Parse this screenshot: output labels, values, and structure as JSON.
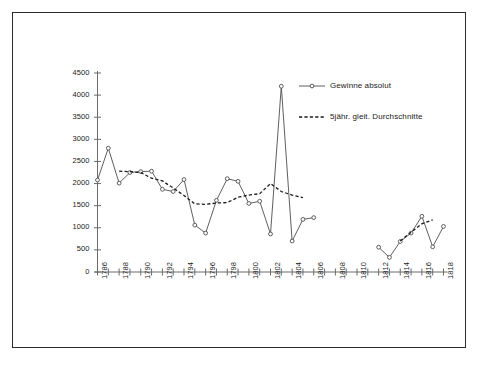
{
  "chart_data": {
    "type": "line",
    "title": "",
    "subtitle": "",
    "xlabel": "",
    "ylabel": "",
    "xlim": [
      1786,
      1818
    ],
    "ylim": [
      0,
      4500
    ],
    "ytick_step": 500,
    "xtick_step": 1,
    "xtick_label_step": 2,
    "grid": false,
    "legend_position": "top-right",
    "yticks": [
      0,
      500,
      1000,
      1500,
      2000,
      2500,
      3000,
      3500,
      4000,
      4500
    ],
    "ytick_labels": [
      "0",
      "500",
      "1000",
      "1500",
      "2000",
      "2500",
      "3000",
      "3500",
      "4000",
      "4500"
    ],
    "xticks": [
      1786,
      1787,
      1788,
      1789,
      1790,
      1791,
      1792,
      1793,
      1794,
      1795,
      1796,
      1797,
      1798,
      1799,
      1800,
      1801,
      1802,
      1803,
      1804,
      1805,
      1806,
      1807,
      1808,
      1809,
      1810,
      1811,
      1812,
      1813,
      1814,
      1815,
      1816,
      1817,
      1818
    ],
    "xtick_labels": [
      "1786",
      "",
      "1788",
      "",
      "1790",
      "",
      "1792",
      "",
      "1794",
      "",
      "1796",
      "",
      "1798",
      "",
      "1800",
      "",
      "1802",
      "",
      "1804",
      "",
      "1806",
      "",
      "1808",
      "",
      "1810",
      "",
      "1812",
      "",
      "1814",
      "",
      "1816",
      "",
      "1818"
    ],
    "series": [
      {
        "name": "Gewinne absolut",
        "style": "solid",
        "marker": "open-circle",
        "color": "#4d4d4d",
        "points": [
          {
            "x": 1786,
            "y": 2080
          },
          {
            "x": 1787,
            "y": 2800
          },
          {
            "x": 1788,
            "y": 2010
          },
          {
            "x": 1789,
            "y": 2250
          },
          {
            "x": 1790,
            "y": 2270
          },
          {
            "x": 1791,
            "y": 2280
          },
          {
            "x": 1792,
            "y": 1870
          },
          {
            "x": 1793,
            "y": 1820
          },
          {
            "x": 1794,
            "y": 2090
          },
          {
            "x": 1795,
            "y": 1060
          },
          {
            "x": 1796,
            "y": 880
          },
          {
            "x": 1797,
            "y": 1620
          },
          {
            "x": 1798,
            "y": 2110
          },
          {
            "x": 1799,
            "y": 2050
          },
          {
            "x": 1800,
            "y": 1550
          },
          {
            "x": 1801,
            "y": 1600
          },
          {
            "x": 1802,
            "y": 860
          },
          {
            "x": 1803,
            "y": 4200
          },
          {
            "x": 1804,
            "y": 700
          },
          {
            "x": 1805,
            "y": 1190
          },
          {
            "x": 1806,
            "y": 1230
          }
        ]
      },
      {
        "name": "Gewinne absolut",
        "style": "solid",
        "marker": "open-circle",
        "color": "#4d4d4d",
        "segment": "late",
        "points": [
          {
            "x": 1812,
            "y": 560
          },
          {
            "x": 1813,
            "y": 330
          },
          {
            "x": 1814,
            "y": 690
          },
          {
            "x": 1815,
            "y": 880
          },
          {
            "x": 1816,
            "y": 1260
          },
          {
            "x": 1817,
            "y": 570
          },
          {
            "x": 1818,
            "y": 1030
          }
        ]
      },
      {
        "name": "5jähr. gleit. Durchschnitte",
        "style": "dashed",
        "marker": "none",
        "color": "#1a1a1a",
        "points": [
          {
            "x": 1788,
            "y": 2280
          },
          {
            "x": 1789,
            "y": 2270
          },
          {
            "x": 1790,
            "y": 2250
          },
          {
            "x": 1791,
            "y": 2120
          },
          {
            "x": 1792,
            "y": 2060
          },
          {
            "x": 1793,
            "y": 1900
          },
          {
            "x": 1794,
            "y": 1730
          },
          {
            "x": 1795,
            "y": 1540
          },
          {
            "x": 1796,
            "y": 1530
          },
          {
            "x": 1797,
            "y": 1560
          },
          {
            "x": 1798,
            "y": 1570
          },
          {
            "x": 1799,
            "y": 1690
          },
          {
            "x": 1800,
            "y": 1740
          },
          {
            "x": 1801,
            "y": 1770
          },
          {
            "x": 1802,
            "y": 2000
          },
          {
            "x": 1803,
            "y": 1820
          },
          {
            "x": 1804,
            "y": 1740
          },
          {
            "x": 1805,
            "y": 1680
          }
        ]
      },
      {
        "name": "5jähr. gleit. Durchschnitte",
        "style": "dashed",
        "marker": "none",
        "segment": "late",
        "color": "#1a1a1a",
        "points": [
          {
            "x": 1814,
            "y": 700
          },
          {
            "x": 1815,
            "y": 900
          },
          {
            "x": 1816,
            "y": 1090
          },
          {
            "x": 1817,
            "y": 1180
          }
        ]
      }
    ],
    "legend": [
      {
        "label": "Gewinne absolut",
        "style": "solid",
        "marker": "open-circle"
      },
      {
        "label": "5jähr. gleit. Durchschnitte",
        "style": "dashed",
        "marker": "none"
      }
    ]
  },
  "axes": {
    "y_axis_name": "value-axis",
    "x_axis_name": "year-axis"
  }
}
